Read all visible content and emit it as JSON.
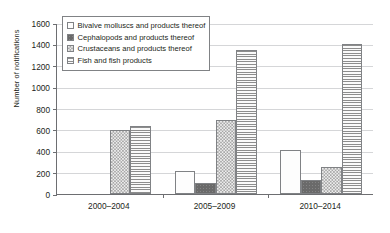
{
  "chart_data": {
    "type": "bar",
    "title": "",
    "xlabel": "",
    "ylabel": "Number of notifications",
    "ylim": [
      0,
      1600
    ],
    "ytick_step": 200,
    "yticks": [
      0,
      200,
      400,
      600,
      800,
      1000,
      1200,
      1400,
      1600
    ],
    "grid": true,
    "legend_position": "top-left-inside",
    "categories": [
      "2000–2004",
      "2005–2009",
      "2010–2014"
    ],
    "series": [
      {
        "name": "Bivalve molluscs and products thereof",
        "pattern": "light-dots",
        "values": [
          0,
          215,
          410
        ]
      },
      {
        "name": "Cephalopods and products thereof",
        "pattern": "dark-solid",
        "values": [
          0,
          100,
          135
        ]
      },
      {
        "name": "Crustaceans and products thereof",
        "pattern": "checkerboard",
        "values": [
          595,
          690,
          250
        ]
      },
      {
        "name": "Fish and fish products",
        "pattern": "horizontal-lines",
        "values": [
          635,
          1345,
          1400
        ]
      }
    ]
  },
  "colors": {
    "axis": "#6d6e71",
    "grid": "#d5d6d8",
    "bar_border": "#808285",
    "text": "#231f20",
    "background": "#ffffff"
  }
}
